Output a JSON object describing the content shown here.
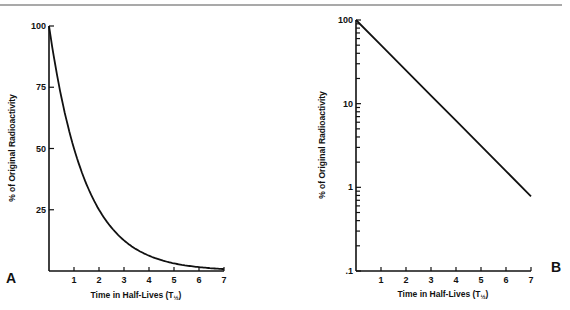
{
  "chart_data": [
    {
      "panel": "A",
      "type": "line",
      "title": "",
      "xlabel": "Time in Half-Lives (T",
      "xlabel_subscript": "½",
      "xlabel_close": ")",
      "ylabel": "% of Original Radioactivity",
      "xlim": [
        0,
        7
      ],
      "ylim": [
        0,
        100
      ],
      "yscale": "linear",
      "xticks": [
        1,
        2,
        3,
        4,
        5,
        6,
        7
      ],
      "yticks": [
        100,
        75,
        50,
        25
      ],
      "ytick_labels": [
        "100",
        "75",
        "50",
        "25"
      ],
      "grid": false,
      "series": [
        {
          "name": "decay",
          "x": [
            0,
            0.5,
            1,
            1.5,
            2,
            2.5,
            3,
            3.5,
            4,
            4.5,
            5,
            5.5,
            6,
            6.5,
            7
          ],
          "y": [
            100,
            70.7,
            50,
            35.4,
            25,
            17.7,
            12.5,
            8.8,
            6.25,
            4.4,
            3.1,
            2.2,
            1.6,
            1.1,
            0.78
          ]
        }
      ]
    },
    {
      "panel": "B",
      "type": "line",
      "title": "",
      "xlabel": "Time in Half-Lives (T",
      "xlabel_subscript": "½",
      "xlabel_close": ")",
      "ylabel": "% of Original Radioactivity",
      "xlim": [
        0,
        7
      ],
      "ylim": [
        0.1,
        100
      ],
      "yscale": "log",
      "xticks": [
        1,
        2,
        3,
        4,
        5,
        6,
        7
      ],
      "yticks": [
        100,
        10,
        1,
        0.1
      ],
      "ytick_labels": [
        "100",
        "10",
        "1",
        ".1"
      ],
      "grid": false,
      "series": [
        {
          "name": "decay",
          "x": [
            0,
            1,
            2,
            3,
            4,
            5,
            6,
            7
          ],
          "y": [
            100,
            50,
            25,
            12.5,
            6.25,
            3.125,
            1.5625,
            0.78
          ]
        }
      ]
    }
  ]
}
